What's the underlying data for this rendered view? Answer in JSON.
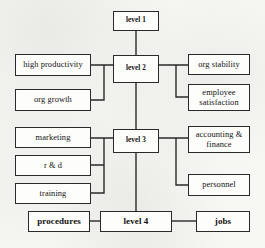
{
  "diagram": {
    "type": "block-hierarchy",
    "background_color": "#f7f7f4",
    "line_color": "#2a2a2a",
    "box_fill_color": "#fdfdfb",
    "nodes": [
      {
        "id": "level1",
        "label": "level 1",
        "style": "level",
        "x": 113,
        "y": 11,
        "w": 46,
        "h": 20
      },
      {
        "id": "level2",
        "label": "level 2",
        "style": "level",
        "x": 113,
        "y": 55,
        "w": 46,
        "h": 28
      },
      {
        "id": "level3",
        "label": "level 3",
        "style": "level",
        "x": 113,
        "y": 129,
        "w": 46,
        "h": 24
      },
      {
        "id": "level4",
        "label": "level 4",
        "style": "bold",
        "x": 100,
        "y": 211,
        "w": 72,
        "h": 21
      },
      {
        "id": "highprod",
        "label": "high productivity",
        "style": "plain",
        "x": 15,
        "y": 54,
        "w": 76,
        "h": 22
      },
      {
        "id": "orggrowth",
        "label": "org growth",
        "style": "plain",
        "x": 15,
        "y": 89,
        "w": 76,
        "h": 22
      },
      {
        "id": "orgstability",
        "label": "org stability",
        "style": "plain",
        "x": 188,
        "y": 54,
        "w": 62,
        "h": 21
      },
      {
        "id": "empsat",
        "label": "employee\nsatisfaction",
        "style": "plain",
        "x": 188,
        "y": 84,
        "w": 62,
        "h": 27
      },
      {
        "id": "marketing",
        "label": "marketing",
        "style": "plain",
        "x": 15,
        "y": 127,
        "w": 76,
        "h": 21
      },
      {
        "id": "rd",
        "label": "r & d",
        "style": "plain",
        "x": 15,
        "y": 155,
        "w": 76,
        "h": 21
      },
      {
        "id": "training",
        "label": "training",
        "style": "plain",
        "x": 15,
        "y": 183,
        "w": 76,
        "h": 21
      },
      {
        "id": "acctfin",
        "label": "accounting &\nfinance",
        "style": "plain",
        "x": 188,
        "y": 126,
        "w": 62,
        "h": 27
      },
      {
        "id": "personnel",
        "label": "personnel",
        "style": "plain",
        "x": 188,
        "y": 174,
        "w": 62,
        "h": 22
      },
      {
        "id": "procedures",
        "label": "procedures",
        "style": "bold",
        "x": 28,
        "y": 211,
        "w": 62,
        "h": 21
      },
      {
        "id": "jobs",
        "label": "jobs",
        "style": "bold",
        "x": 196,
        "y": 211,
        "w": 54,
        "h": 21
      }
    ],
    "connectors": [
      {
        "id": "c-level1-level2",
        "from": "level1",
        "to": "level2",
        "path": "M136,31 L136,55"
      },
      {
        "id": "c-level2-level3",
        "from": "level2",
        "to": "level3",
        "path": "M136,83 L136,129"
      },
      {
        "id": "c-level3-level4",
        "from": "level3",
        "to": "level4",
        "path": "M136,153 L136,211"
      },
      {
        "id": "c-left2-bus",
        "from": "left-group-2",
        "to": "level2",
        "path": "M91,65 L104,65 L104,100 L91,100 M104,65 L113,65"
      },
      {
        "id": "c-right2-bus",
        "from": "level2",
        "to": "right-group-2",
        "path": "M159,65 L176,65 L176,97 L188,97 M176,65 L188,65"
      },
      {
        "id": "c-left3-bus",
        "from": "left-group-3",
        "to": "level3",
        "path": "M91,138 L104,138 L104,193 L91,193 M104,165 L91,165 M104,138 L113,138"
      },
      {
        "id": "c-right3-bus",
        "from": "level3",
        "to": "right-group-3",
        "path": "M159,138 L176,138 L176,185 L188,185 M176,138 L188,138"
      },
      {
        "id": "c-proc-level4",
        "from": "procedures",
        "to": "level4",
        "path": "M90,221 L100,221"
      },
      {
        "id": "c-level4-jobs",
        "from": "level4",
        "to": "jobs",
        "path": "M172,221 L196,221"
      }
    ]
  }
}
